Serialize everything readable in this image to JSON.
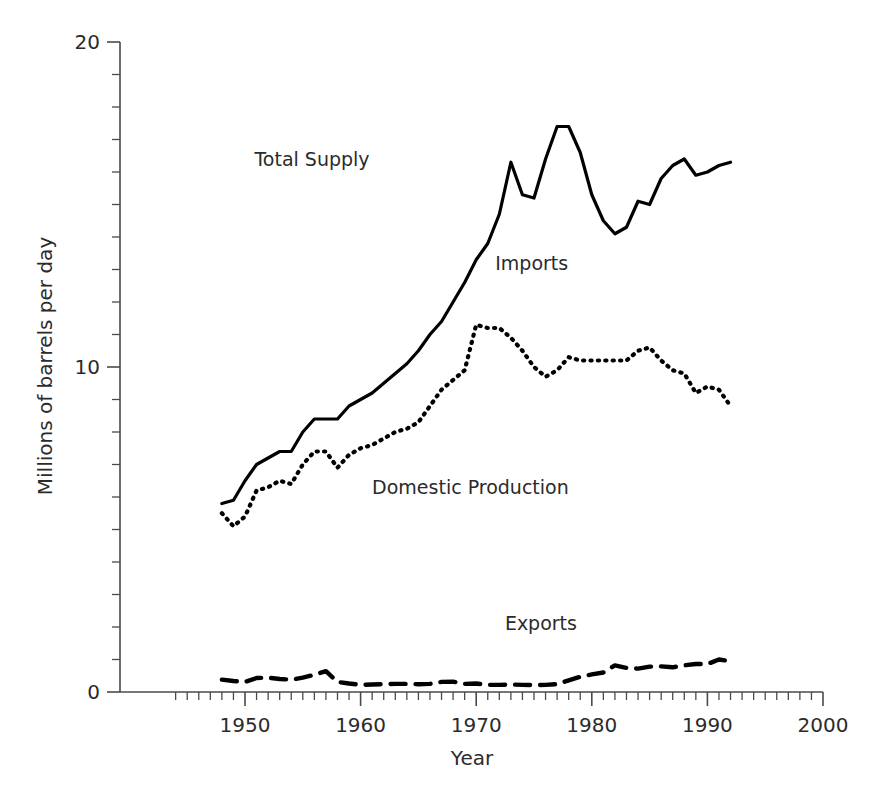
{
  "chart_data": {
    "type": "line",
    "title": "",
    "subtitle": "",
    "xlabel": "Year",
    "ylabel": "Millions of barrels per day",
    "xlim": [
      1943,
      2000
    ],
    "ylim": [
      0,
      20
    ],
    "grid": false,
    "legend_position": "inline-annotations",
    "x_ticks_major": [
      1950,
      1960,
      1970,
      1980,
      1990,
      2000
    ],
    "x_tick_labels": [
      "1950",
      "1960",
      "1970",
      "1980",
      "1990",
      "2000"
    ],
    "x_tick_minor_step": 1,
    "y_ticks_major": [
      0,
      10,
      20
    ],
    "y_tick_labels": [
      "0",
      "10",
      "20"
    ],
    "y_tick_minor_step": 1,
    "annotations": [
      {
        "text": "Total Supply",
        "x": 1955.8,
        "y": 16.2,
        "series": "Total Supply"
      },
      {
        "text": "Imports",
        "x": 1974.8,
        "y": 13.0,
        "series": "Imports"
      },
      {
        "text": "Domestic Production",
        "x": 1969.5,
        "y": 6.1,
        "series": "Domestic Production"
      },
      {
        "text": "Exports",
        "x": 1975.6,
        "y": 1.9,
        "series": "Exports"
      }
    ],
    "series": [
      {
        "name": "Total Supply",
        "style": "solid",
        "color": "#000000",
        "x": [
          1948,
          1949,
          1950,
          1951,
          1952,
          1953,
          1954,
          1955,
          1956,
          1957,
          1958,
          1959,
          1960,
          1961,
          1962,
          1963,
          1964,
          1965,
          1966,
          1967,
          1968,
          1969,
          1970,
          1971,
          1972,
          1973,
          1974,
          1975,
          1976,
          1977,
          1978,
          1979,
          1980,
          1981,
          1982,
          1983,
          1984,
          1985,
          1986,
          1987,
          1988,
          1989,
          1990,
          1991,
          1992
        ],
        "values": [
          5.8,
          5.9,
          6.5,
          7.0,
          7.2,
          7.4,
          7.4,
          8.0,
          8.4,
          8.4,
          8.4,
          8.8,
          9.0,
          9.2,
          9.5,
          9.8,
          10.1,
          10.5,
          11.0,
          11.4,
          12.0,
          12.6,
          13.3,
          13.8,
          14.7,
          16.3,
          15.3,
          15.2,
          16.4,
          17.4,
          17.4,
          16.6,
          15.3,
          14.5,
          14.1,
          14.3,
          15.1,
          15.0,
          15.8,
          16.2,
          16.4,
          15.9,
          16.0,
          16.2,
          16.3
        ]
      },
      {
        "name": "Domestic Production",
        "style": "dotted",
        "color": "#000000",
        "x": [
          1948,
          1949,
          1950,
          1951,
          1952,
          1953,
          1954,
          1955,
          1956,
          1957,
          1958,
          1959,
          1960,
          1961,
          1962,
          1963,
          1964,
          1965,
          1966,
          1967,
          1968,
          1969,
          1970,
          1971,
          1972,
          1973,
          1974,
          1975,
          1976,
          1977,
          1978,
          1979,
          1980,
          1981,
          1982,
          1983,
          1984,
          1985,
          1986,
          1987,
          1988,
          1989,
          1990,
          1991,
          1992
        ],
        "values": [
          5.5,
          5.1,
          5.4,
          6.2,
          6.3,
          6.5,
          6.4,
          7.0,
          7.4,
          7.4,
          6.9,
          7.3,
          7.5,
          7.6,
          7.8,
          8.0,
          8.1,
          8.3,
          8.8,
          9.3,
          9.6,
          9.9,
          11.3,
          11.2,
          11.2,
          10.9,
          10.5,
          10.0,
          9.7,
          9.9,
          10.3,
          10.2,
          10.2,
          10.2,
          10.2,
          10.2,
          10.5,
          10.6,
          10.2,
          9.9,
          9.8,
          9.2,
          9.4,
          9.3,
          8.8
        ]
      },
      {
        "name": "Exports",
        "style": "dashed",
        "color": "#000000",
        "x": [
          1948,
          1949,
          1950,
          1951,
          1952,
          1953,
          1954,
          1955,
          1956,
          1957,
          1958,
          1959,
          1960,
          1961,
          1962,
          1963,
          1964,
          1965,
          1966,
          1967,
          1968,
          1969,
          1970,
          1971,
          1972,
          1973,
          1974,
          1975,
          1976,
          1977,
          1978,
          1979,
          1980,
          1981,
          1982,
          1983,
          1984,
          1985,
          1986,
          1987,
          1988,
          1989,
          1990,
          1991,
          1992
        ],
        "values": [
          0.38,
          0.34,
          0.31,
          0.43,
          0.44,
          0.4,
          0.38,
          0.44,
          0.53,
          0.64,
          0.31,
          0.26,
          0.22,
          0.23,
          0.24,
          0.25,
          0.25,
          0.24,
          0.25,
          0.31,
          0.32,
          0.25,
          0.26,
          0.22,
          0.22,
          0.23,
          0.22,
          0.21,
          0.22,
          0.24,
          0.36,
          0.47,
          0.54,
          0.6,
          0.82,
          0.74,
          0.72,
          0.78,
          0.79,
          0.76,
          0.82,
          0.86,
          0.86,
          1.0,
          0.95
        ]
      },
      {
        "name": "Imports",
        "style": "implied-gap",
        "color": "#000000",
        "description": "Region between Total Supply and Domestic Production curves"
      }
    ]
  }
}
